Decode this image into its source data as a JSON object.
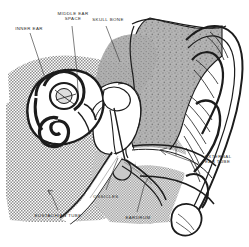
{
  "figure": {
    "kind": "anatomical-cross-section",
    "width": 249,
    "height": 247,
    "background_color": "#ffffff",
    "ink_color": "#1c1c1c",
    "bone_fill_color": "#a8a8a8",
    "tissue_hatch_color": "#9a9a9a",
    "cavity_fill_color": "#ffffff"
  },
  "labels": {
    "inner_ear": "INNER EAR",
    "middle_ear_space": "MIDDLE EAR\nSPACE",
    "skull_bone": "SKULL BONE",
    "external_ear_tube": "EXTERNAL\nEAR TUBE",
    "ossicles": "OSSICLES",
    "eardrum": "EARDRUM",
    "eustachian_tube": "EUSTACHIAN TUBE"
  },
  "regions": {
    "inner_ear_note": "cochlea and semicircular canals, dark outlined, left of center",
    "middle_ear_note": "air space containing ossicles",
    "skull_bone_note": "stippled grey mass, upper centre-right",
    "external_ear_tube_note": "canal from pinna to eardrum, arrow points into canal",
    "ossicles_note": "malleus, incus, stapes chain",
    "eardrum_note": "membrane at inner end of ear canal",
    "eustachian_tube_note": "tube descending from middle ear toward throat"
  }
}
